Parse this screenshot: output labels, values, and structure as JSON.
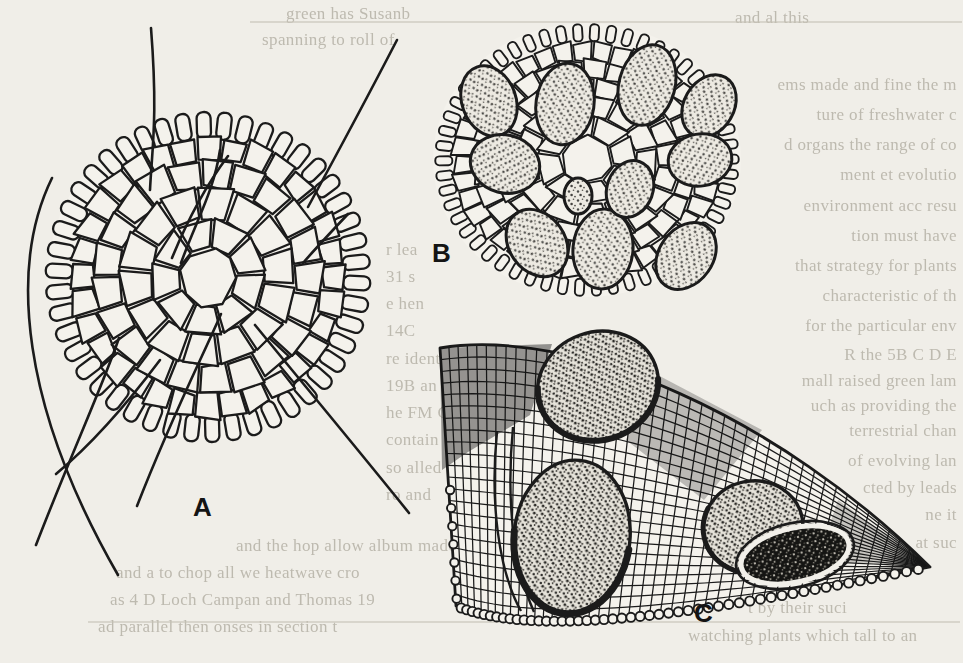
{
  "page": {
    "paper_color": "#f0eee8",
    "ink_color": "#1b1b1b",
    "faint_text_color": "#b5b1a6"
  },
  "figure": {
    "panel_labels": {
      "a": "A",
      "b": "B",
      "c": "C"
    }
  },
  "bleed_text": {
    "top": [
      {
        "x": 286,
        "y": 4,
        "text": "green has Susanb"
      },
      {
        "x": 735,
        "y": 8,
        "text": "and al this"
      },
      {
        "x": 262,
        "y": 30,
        "text": "spanning to roll of"
      }
    ],
    "right_column": [
      {
        "y": 75,
        "text": "ems made and fine the m"
      },
      {
        "y": 105,
        "text": "ture of freshwater c"
      },
      {
        "y": 135,
        "text": "d organs the range of co"
      },
      {
        "y": 165,
        "text": "ment et evolutio"
      },
      {
        "y": 196,
        "text": "environment acc resu"
      },
      {
        "y": 226,
        "text": "tion must have"
      },
      {
        "y": 256,
        "text": "that strategy for plants"
      },
      {
        "y": 286,
        "text": "characteristic of th"
      },
      {
        "y": 316,
        "text": "for the particular env"
      },
      {
        "y": 345,
        "text": "R the 5B C D E"
      },
      {
        "y": 371,
        "text": "mall raised green lam"
      },
      {
        "y": 396,
        "text": "uch as providing the"
      },
      {
        "y": 421,
        "text": "terrestrial chan"
      },
      {
        "y": 451,
        "text": "of evolving lan"
      },
      {
        "y": 478,
        "text": "cted by leads"
      },
      {
        "y": 505,
        "text": "ne it"
      },
      {
        "y": 533,
        "text": "at suc"
      }
    ],
    "middle_column": [
      {
        "x": 386,
        "y": 240,
        "text": "r lea"
      },
      {
        "x": 386,
        "y": 267,
        "text": "31 s"
      },
      {
        "x": 386,
        "y": 294,
        "text": "e hen"
      },
      {
        "x": 386,
        "y": 321,
        "text": "14C"
      },
      {
        "x": 386,
        "y": 349,
        "text": "re identi"
      },
      {
        "x": 386,
        "y": 376,
        "text": "19B an"
      },
      {
        "x": 386,
        "y": 403,
        "text": "he FM C"
      },
      {
        "x": 386,
        "y": 430,
        "text": "contain"
      },
      {
        "x": 386,
        "y": 458,
        "text": "so alled"
      },
      {
        "x": 386,
        "y": 485,
        "text": "ro and"
      }
    ],
    "bottom_left": [
      {
        "x": 236,
        "y": 536,
        "text": "and the hop allow album made t"
      },
      {
        "x": 116,
        "y": 563,
        "text": "and a to chop all we heatwave cro"
      },
      {
        "x": 110,
        "y": 590,
        "text": "as 4 D Loch Campan and Thomas 19"
      },
      {
        "x": 98,
        "y": 617,
        "text": "ad parallel then onses in section t"
      }
    ],
    "bottom_right": [
      {
        "x": 748,
        "y": 598,
        "text": "t by their suci"
      },
      {
        "x": 688,
        "y": 626,
        "text": "watching plants which tall to an"
      }
    ],
    "rules": [
      {
        "x": 250,
        "y": 21,
        "w": 712
      },
      {
        "x": 88,
        "y": 621,
        "w": 872
      }
    ]
  }
}
